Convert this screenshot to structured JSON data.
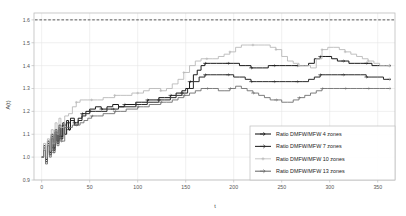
{
  "chart_data": {
    "type": "line",
    "title": "",
    "xlabel": "t",
    "ylabel": "A(t)",
    "xlim": [
      -8,
      368
    ],
    "ylim": [
      0.9,
      1.63
    ],
    "xticks": [
      0,
      50,
      100,
      150,
      200,
      250,
      300,
      350
    ],
    "yticks": [
      0.9,
      1.0,
      1.1,
      1.2,
      1.3,
      1.4,
      1.5,
      1.6
    ],
    "grid": true,
    "legend_position": "lower right",
    "reference_line": {
      "value": 1.6,
      "style": "dashed",
      "color": "#333333"
    },
    "series": [
      {
        "name": "Ratio DMFW/MFW 4 zones",
        "color": "#1a1a1a",
        "width": 1.0,
        "marker": "arrow",
        "x": [
          0,
          2,
          4,
          6,
          8,
          10,
          12,
          14,
          16,
          18,
          20,
          22,
          24,
          26,
          28,
          30,
          34,
          38,
          42,
          46,
          50,
          56,
          62,
          68,
          74,
          80,
          86,
          92,
          98,
          104,
          110,
          116,
          122,
          128,
          134,
          140,
          146,
          150,
          154,
          158,
          162,
          166,
          170,
          176,
          182,
          188,
          194,
          200,
          206,
          212,
          218,
          224,
          230,
          236,
          242,
          248,
          254,
          260,
          266,
          272,
          278,
          284,
          290,
          296,
          302,
          308,
          314,
          320,
          326,
          332,
          338,
          344,
          350,
          356,
          362
        ],
        "y": [
          1.0,
          1.05,
          0.99,
          1.07,
          1.02,
          1.1,
          1.04,
          1.12,
          1.07,
          1.14,
          1.09,
          1.15,
          1.1,
          1.16,
          1.12,
          1.17,
          1.14,
          1.17,
          1.19,
          1.2,
          1.21,
          1.22,
          1.21,
          1.22,
          1.23,
          1.22,
          1.23,
          1.23,
          1.24,
          1.24,
          1.25,
          1.25,
          1.26,
          1.26,
          1.27,
          1.28,
          1.29,
          1.3,
          1.33,
          1.36,
          1.38,
          1.4,
          1.41,
          1.41,
          1.41,
          1.41,
          1.41,
          1.41,
          1.4,
          1.4,
          1.39,
          1.39,
          1.39,
          1.4,
          1.4,
          1.4,
          1.4,
          1.4,
          1.4,
          1.4,
          1.41,
          1.43,
          1.44,
          1.44,
          1.43,
          1.42,
          1.42,
          1.41,
          1.41,
          1.41,
          1.41,
          1.4,
          1.4,
          1.4,
          1.4
        ]
      },
      {
        "name": "Ratio DMFW/MFW 7 zones",
        "color": "#2b2b2b",
        "width": 1.0,
        "marker": "arrow",
        "x": [
          0,
          2,
          4,
          6,
          8,
          10,
          12,
          14,
          16,
          18,
          20,
          22,
          26,
          30,
          34,
          38,
          42,
          46,
          50,
          56,
          62,
          68,
          74,
          80,
          86,
          92,
          98,
          104,
          110,
          116,
          122,
          128,
          134,
          140,
          146,
          152,
          158,
          164,
          170,
          176,
          182,
          188,
          194,
          200,
          206,
          212,
          218,
          224,
          230,
          236,
          242,
          248,
          254,
          260,
          266,
          272,
          278,
          284,
          290,
          296,
          302,
          308,
          314,
          320,
          326,
          332,
          338,
          344,
          350,
          356,
          362
        ],
        "y": [
          1.0,
          1.04,
          0.98,
          1.06,
          1.01,
          1.09,
          1.03,
          1.11,
          1.06,
          1.13,
          1.08,
          1.14,
          1.15,
          1.16,
          1.15,
          1.16,
          1.18,
          1.19,
          1.2,
          1.2,
          1.2,
          1.21,
          1.21,
          1.22,
          1.22,
          1.22,
          1.23,
          1.23,
          1.24,
          1.24,
          1.25,
          1.25,
          1.26,
          1.27,
          1.28,
          1.3,
          1.33,
          1.35,
          1.36,
          1.36,
          1.36,
          1.36,
          1.36,
          1.35,
          1.35,
          1.34,
          1.33,
          1.33,
          1.33,
          1.33,
          1.33,
          1.33,
          1.33,
          1.33,
          1.33,
          1.33,
          1.34,
          1.35,
          1.36,
          1.36,
          1.36,
          1.36,
          1.36,
          1.36,
          1.36,
          1.36,
          1.35,
          1.35,
          1.35,
          1.34,
          1.34
        ]
      },
      {
        "name": "Ratio DMFW/MFW 10 zones",
        "color": "#b9b9b9",
        "width": 0.9,
        "marker": "plus",
        "x": [
          0,
          2,
          4,
          6,
          8,
          10,
          12,
          14,
          16,
          18,
          20,
          24,
          28,
          32,
          36,
          40,
          44,
          48,
          52,
          58,
          64,
          70,
          76,
          82,
          88,
          94,
          100,
          106,
          112,
          118,
          124,
          130,
          136,
          142,
          148,
          154,
          160,
          166,
          172,
          178,
          184,
          190,
          196,
          202,
          208,
          214,
          220,
          226,
          232,
          238,
          244,
          250,
          256,
          262,
          268,
          274,
          280,
          286,
          292,
          298,
          304,
          310,
          316,
          322,
          328,
          334,
          340,
          346,
          352,
          358,
          362
        ],
        "y": [
          1.0,
          1.06,
          1.0,
          1.08,
          1.03,
          1.12,
          1.06,
          1.15,
          1.1,
          1.17,
          1.13,
          1.18,
          1.19,
          1.22,
          1.24,
          1.25,
          1.25,
          1.25,
          1.25,
          1.25,
          1.26,
          1.26,
          1.27,
          1.27,
          1.27,
          1.28,
          1.28,
          1.29,
          1.3,
          1.3,
          1.29,
          1.3,
          1.32,
          1.34,
          1.37,
          1.4,
          1.42,
          1.43,
          1.43,
          1.43,
          1.44,
          1.45,
          1.46,
          1.48,
          1.49,
          1.49,
          1.49,
          1.49,
          1.49,
          1.48,
          1.47,
          1.44,
          1.42,
          1.41,
          1.4,
          1.4,
          1.39,
          1.43,
          1.47,
          1.48,
          1.48,
          1.47,
          1.46,
          1.45,
          1.44,
          1.43,
          1.42,
          1.41,
          1.4,
          1.4,
          1.4
        ]
      },
      {
        "name": "Ratio DMFW/MFW 13 zones",
        "color": "#6f6f6f",
        "width": 0.9,
        "marker": "arrow",
        "x": [
          0,
          2,
          4,
          6,
          8,
          10,
          12,
          14,
          16,
          18,
          20,
          24,
          28,
          32,
          36,
          40,
          44,
          48,
          52,
          58,
          64,
          70,
          76,
          82,
          88,
          94,
          100,
          106,
          112,
          118,
          124,
          130,
          136,
          142,
          148,
          154,
          160,
          166,
          172,
          178,
          184,
          190,
          196,
          202,
          208,
          214,
          220,
          226,
          232,
          238,
          244,
          250,
          256,
          262,
          268,
          274,
          280,
          286,
          292,
          298,
          304,
          310,
          316,
          322,
          328,
          334,
          340,
          346,
          352,
          358,
          362
        ],
        "y": [
          1.0,
          1.03,
          0.97,
          1.05,
          1.0,
          1.08,
          1.02,
          1.1,
          1.05,
          1.12,
          1.07,
          1.13,
          1.13,
          1.14,
          1.14,
          1.15,
          1.16,
          1.17,
          1.18,
          1.18,
          1.19,
          1.19,
          1.2,
          1.2,
          1.21,
          1.21,
          1.22,
          1.22,
          1.23,
          1.23,
          1.24,
          1.24,
          1.25,
          1.26,
          1.27,
          1.28,
          1.29,
          1.3,
          1.3,
          1.3,
          1.29,
          1.29,
          1.3,
          1.31,
          1.3,
          1.29,
          1.28,
          1.27,
          1.26,
          1.25,
          1.25,
          1.24,
          1.24,
          1.25,
          1.26,
          1.27,
          1.28,
          1.29,
          1.3,
          1.3,
          1.3,
          1.3,
          1.3,
          1.3,
          1.3,
          1.3,
          1.3,
          1.3,
          1.3,
          1.3,
          1.3
        ]
      }
    ]
  },
  "axes": {
    "ylabel": "A(t)",
    "xlabel": "t",
    "ytick_labels": [
      "1.6",
      "1.5",
      "1.4",
      "1.3",
      "1.2",
      "1.1",
      "1.0",
      "0.9"
    ],
    "xtick_labels": [
      "0",
      "50",
      "100",
      "150",
      "200",
      "250",
      "300",
      "350"
    ]
  },
  "legend": {
    "items": [
      {
        "label": "Ratio DMFW/MFW 4 zones",
        "color": "#1a1a1a",
        "marker": "arrow"
      },
      {
        "label": "Ratio DMFW/MFW 7 zones",
        "color": "#2b2b2b",
        "marker": "arrow"
      },
      {
        "label": "Ratio DMFW/MFW 10 zones",
        "color": "#b9b9b9",
        "marker": "plus"
      },
      {
        "label": "Ratio DMFW/MFW 13 zones",
        "color": "#6f6f6f",
        "marker": "arrow"
      }
    ]
  },
  "colors": {
    "grid": "#e6e6e6",
    "frame": "#bdbdbd",
    "text": "#555555",
    "background": "#ffffff"
  }
}
